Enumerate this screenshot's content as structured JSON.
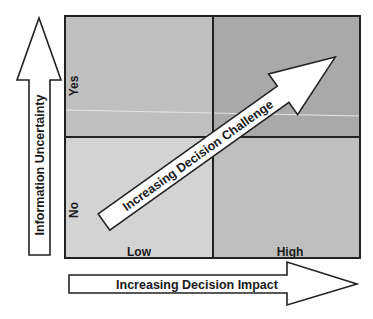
{
  "diagram": {
    "type": "2x2 matrix",
    "x_axis": {
      "label": "Increasing Decision Impact",
      "categories": [
        "Low",
        "High"
      ]
    },
    "y_axis": {
      "label": "Information Uncertainty",
      "categories": [
        "No",
        "Yes"
      ]
    },
    "diagonal_arrow": {
      "label": "Increasing Decision Challenge"
    },
    "quadrants": [
      {
        "id": "top-left",
        "impact": "Low",
        "uncertainty": "Yes",
        "color": "#bfbfbf"
      },
      {
        "id": "top-right",
        "impact": "High",
        "uncertainty": "Yes",
        "color": "#a9a9a9"
      },
      {
        "id": "bottom-left",
        "impact": "Low",
        "uncertainty": "No",
        "color": "#d3d3d3"
      },
      {
        "id": "bottom-right",
        "impact": "High",
        "uncertainty": "No",
        "color": "#bfbfbf"
      }
    ],
    "colors": {
      "outline": "#222222",
      "arrow_fill": "#ffffff"
    }
  }
}
